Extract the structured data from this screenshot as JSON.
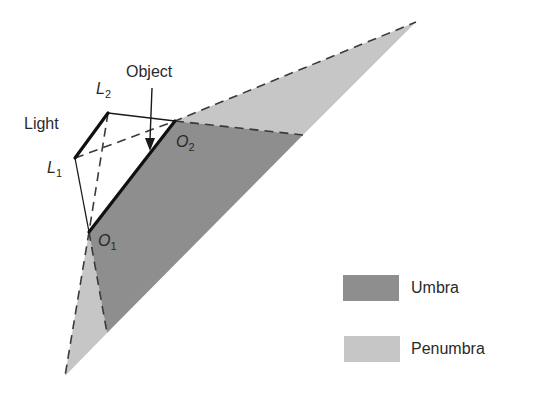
{
  "diagram": {
    "colors": {
      "umbra": "#8e8e8e",
      "penumbra": "#c6c6c6",
      "line": "#1a1a1a",
      "dash": "#444444"
    },
    "labels": {
      "object": "Object",
      "light": "Light",
      "l2_main": "L",
      "l2_sub": "2",
      "l1_main": "L",
      "l1_sub": "1",
      "o2_main": "O",
      "o2_sub": "2",
      "o1_main": "O",
      "o1_sub": "1"
    },
    "points": {
      "L1": [
        75,
        158
      ],
      "L2": [
        108,
        113
      ],
      "O1": [
        89,
        232
      ],
      "O2": [
        175,
        121
      ],
      "top_apex": [
        416,
        22
      ],
      "umbra_right": [
        303,
        135
      ],
      "umbra_bottom": [
        107,
        333
      ],
      "bottom_apex": [
        65,
        376
      ]
    }
  },
  "legend": {
    "items": [
      {
        "label": "Umbra",
        "color": "#8e8e8e"
      },
      {
        "label": "Penumbra",
        "color": "#c6c6c6"
      }
    ]
  }
}
